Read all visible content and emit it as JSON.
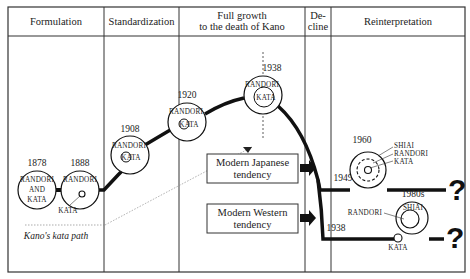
{
  "headers": [
    {
      "line1": "Formulation",
      "line2": ""
    },
    {
      "line1": "Standardization",
      "line2": ""
    },
    {
      "line1": "Full growth",
      "line2": "to the death of Kano"
    },
    {
      "line1": "De-",
      "line2": "cline"
    },
    {
      "line1": "Reinterpretation",
      "line2": ""
    }
  ],
  "nodes": [
    {
      "year": "1878",
      "labels": [
        "RANDORI",
        "AND",
        "KATA"
      ]
    },
    {
      "year": "1888",
      "outer": "RANDORI",
      "inner": "KATA"
    },
    {
      "year": "1908",
      "outer": "RANDORI",
      "inner": "KATA"
    },
    {
      "year": "1920",
      "outer": "RANDORI",
      "inner": "KATA"
    },
    {
      "year": "1938",
      "outer": "RANDORI",
      "inner": "KATA"
    },
    {
      "year": "1960",
      "labels": [
        "SHIAI",
        "RANDORI",
        "KATA"
      ]
    },
    {
      "year": "1980s",
      "outer": "RANDORI",
      "inner": "SHIAI",
      "detached": "KATA"
    }
  ],
  "kata_path_label": "Kano's kata path",
  "tendencies": [
    {
      "line1": "Modern Japanese",
      "line2": "tendency",
      "branch_year": "1949"
    },
    {
      "line1": "Modern Western",
      "line2": "tendency",
      "branch_year": "1938"
    }
  ],
  "question_mark": "?"
}
